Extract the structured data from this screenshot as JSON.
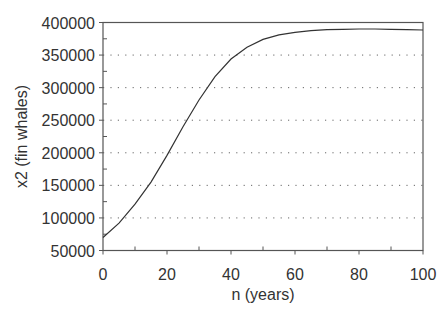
{
  "chart_data": {
    "type": "line",
    "title": "",
    "xlabel": "n (years)",
    "ylabel": "x2 (fin whales)",
    "xlim": [
      0,
      100
    ],
    "ylim": [
      50000,
      400000
    ],
    "xticks": [
      0,
      20,
      40,
      60,
      80,
      100
    ],
    "yticks": [
      50000,
      100000,
      150000,
      200000,
      250000,
      300000,
      350000,
      400000
    ],
    "xtick_labels": [
      "0",
      "20",
      "40",
      "60",
      "80",
      "100"
    ],
    "ytick_labels": [
      "50000",
      "100000",
      "150000",
      "200000",
      "250000",
      "300000",
      "350000",
      "400000"
    ],
    "grid": "horizontal dotted",
    "legend": "none",
    "series": [
      {
        "name": "x2 (fin whales)",
        "x": [
          0,
          5,
          10,
          15,
          20,
          25,
          30,
          35,
          40,
          45,
          50,
          55,
          60,
          65,
          70,
          75,
          80,
          85,
          90,
          95,
          100
        ],
        "values": [
          70000,
          92000,
          121000,
          155000,
          196000,
          240000,
          281000,
          317000,
          344000,
          362000,
          374000,
          381000,
          385000,
          387500,
          389000,
          389500,
          390000,
          390000,
          389500,
          389000,
          388500
        ]
      }
    ]
  },
  "colors": {
    "line": "#333333",
    "axis": "#555555",
    "grid": "#666666",
    "background": "#ffffff"
  }
}
